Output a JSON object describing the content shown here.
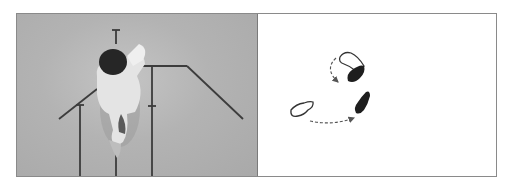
{
  "figure": {
    "panels": [
      {
        "id": "photo",
        "description": "Overhead photograph of a person stepping on a floor marked with guide lines",
        "colors": {
          "floor": "#b3b3b3",
          "lines": "#3c3c3c",
          "hair": "#262626",
          "clothing": "#e6e6e6"
        }
      },
      {
        "id": "diagram",
        "description": "Footprint diagram: outlined footprints show start positions, filled footprints show end positions, dashed arrows show movement paths",
        "legend": {
          "start_footprint": "outline",
          "end_footprint": "filled"
        },
        "colors": {
          "outline": "#333333",
          "fill": "#1e1e1e",
          "arrow": "#555555"
        }
      }
    ]
  }
}
